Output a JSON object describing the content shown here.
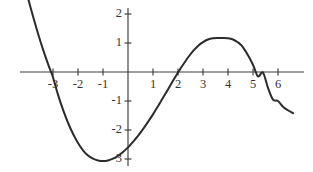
{
  "chart_data": {
    "type": "line",
    "title": "",
    "subtitle": "",
    "xlabel": "",
    "ylabel": "",
    "xlim": [
      -4.3,
      7.3
    ],
    "ylim": [
      -3.6,
      2.4
    ],
    "grid": false,
    "legend": null,
    "legend_position": "none",
    "x_ticks": [
      -3,
      -2,
      -1,
      1,
      2,
      3,
      4,
      5,
      6
    ],
    "x_tick_labels": [
      "-3",
      "-2",
      "-1",
      "1",
      "2",
      "3",
      "4",
      "5",
      "6"
    ],
    "y_ticks": [
      2,
      1,
      -1,
      -2,
      -3
    ],
    "y_tick_labels": [
      "2",
      "1",
      "-1",
      "-2",
      "-3"
    ],
    "axis_color": "#3c3c3c",
    "curve_color": "#2b2b2b",
    "background_color": "#ffffff",
    "annotations": [],
    "series": [
      {
        "name": "curve",
        "x": [
          -4.15,
          -4.0,
          -3.8,
          -3.6,
          -3.4,
          -3.2,
          -3.1,
          -3.0,
          -2.8,
          -2.6,
          -2.4,
          -2.2,
          -2.0,
          -1.8,
          -1.6,
          -1.4,
          -1.2,
          -1.0,
          -0.8,
          -0.6,
          -0.4,
          -0.2,
          0.0,
          0.2,
          0.4,
          0.6,
          0.8,
          1.0,
          1.2,
          1.4,
          1.6,
          1.8,
          2.0,
          2.1,
          2.2,
          2.4,
          2.6,
          2.8,
          3.0,
          3.2,
          3.4,
          3.6,
          3.8,
          4.0,
          4.2,
          4.4,
          4.5,
          4.6,
          4.8,
          5.0,
          5.2,
          5.4,
          5.6,
          5.8,
          6.0,
          6.2,
          6.4,
          6.6
        ],
        "y": [
          3.05,
          2.55,
          1.92,
          1.33,
          0.78,
          0.28,
          0.05,
          -0.18,
          -0.78,
          -1.3,
          -1.75,
          -2.13,
          -2.45,
          -2.7,
          -2.88,
          -2.99,
          -3.05,
          -3.07,
          -3.05,
          -2.99,
          -2.89,
          -2.76,
          -2.6,
          -2.41,
          -2.2,
          -1.97,
          -1.72,
          -1.46,
          -1.18,
          -0.89,
          -0.6,
          -0.3,
          -0.02,
          0.12,
          0.25,
          0.5,
          0.72,
          0.9,
          1.03,
          1.12,
          1.16,
          1.17,
          1.17,
          1.16,
          1.12,
          1.02,
          0.95,
          0.85,
          0.58,
          0.25,
          -0.15,
          -0.02,
          -0.55,
          -0.95,
          -1.0,
          -1.2,
          -1.32,
          -1.42
        ]
      }
    ],
    "key_points": {
      "local_minimum": {
        "x": -0.9,
        "y": -3.07
      },
      "local_maximum": {
        "x": 4.5,
        "y": 1.17
      },
      "x_intercepts": [
        -3.1,
        2.05,
        5.35
      ],
      "y_intercept": -2.6
    }
  },
  "geometry": {
    "origin_px": {
      "x": 128,
      "y": 72
    },
    "x_scale_px_per_unit": 25,
    "y_scale_px_per_unit": 29,
    "x_axis_start_px": 20,
    "x_axis_end_px": 304,
    "y_axis_top_px": 8,
    "y_axis_bottom_px": 166
  }
}
